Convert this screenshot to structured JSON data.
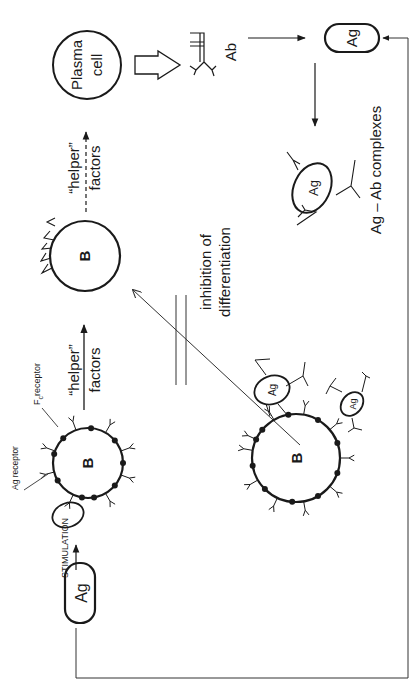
{
  "diagram": {
    "orientation": "rotated 90deg counter-clockwise",
    "colors": {
      "ink": "#1a1a1a",
      "background": "#ffffff"
    },
    "nodes": {
      "ag_start": {
        "label": "Ag"
      },
      "b_cell_1": {
        "label": "B"
      },
      "b_cell_2": {
        "label": "B"
      },
      "b_cell_3": {
        "label": "B"
      },
      "plasma_cell": {
        "label": "Plasma\ncell",
        "line1": "Plasma",
        "line2": "cell"
      },
      "antibody": {
        "label": "Ab"
      },
      "ag_free": {
        "label": "Ag"
      },
      "complex_ag": {
        "label": "Ag"
      },
      "bound_ag_1": {
        "label": "Ag"
      },
      "bound_ag_2": {
        "label": "Ag"
      }
    },
    "labels": {
      "stimulation": "STIMULATION",
      "ag_receptor": "Ag receptor",
      "fc_receptor_main": "F",
      "fc_receptor_sub": "c",
      "fc_receptor_rest": "receptor",
      "helper_factors_1_line1": "“helper”",
      "helper_factors_1_line2": "factors",
      "helper_factors_2_line1": "“helper”",
      "helper_factors_2_line2": "factors",
      "inhibition_line1": "inhibition of",
      "inhibition_line2": "differentiation",
      "complexes": "Ag – Ab complexes"
    },
    "edges": [
      {
        "from": "ag_start",
        "to": "b_cell_1",
        "label": "STIMULATION",
        "style": "solid-arrow"
      },
      {
        "from": "b_cell_1",
        "to": "b_cell_2",
        "label": "“helper” factors",
        "style": "solid-arrow"
      },
      {
        "from": "b_cell_2",
        "to": "plasma_cell",
        "label": "“helper” factors",
        "style": "dashed-arrow"
      },
      {
        "from": "plasma_cell",
        "to": "antibody",
        "style": "hollow-block-arrow"
      },
      {
        "from": "antibody",
        "to": "ag_free",
        "style": "solid-arrow"
      },
      {
        "from": "ag_free",
        "to": "complex_ag",
        "style": "solid-arrow"
      },
      {
        "from": "b_cell_3",
        "to": "b_cell_2",
        "label": "inhibition of differentiation",
        "style": "blocked-arrow"
      },
      {
        "from": "ag_start",
        "to": "ag_free",
        "style": "feedback-loop-arrow"
      }
    ]
  }
}
